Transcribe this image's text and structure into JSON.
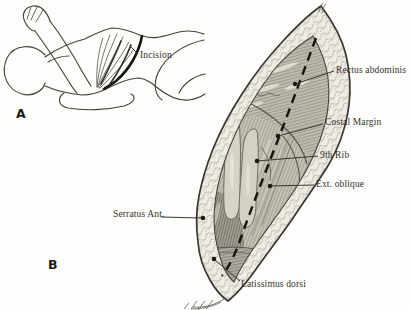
{
  "figure": {
    "colors": {
      "paper": "#fdfdfc",
      "ink": "#3a362f",
      "label_text": "#35302a",
      "dashed_incision_line": "#17140f",
      "muscle_base": "#c7c3b7",
      "fat_band": "#eeece4"
    }
  },
  "panel_a": {
    "letter": "A",
    "incision_label": "Incision"
  },
  "panel_b": {
    "letter": "B",
    "labels": {
      "rectus": "Rectus abdominis",
      "costal_margin": "Costal Margin",
      "ninth_rib": "9th Rib",
      "ext_oblique": "Ext. oblique",
      "serratus": "Serratus Ant.",
      "latissimus": "Latissimus dorsi"
    }
  }
}
